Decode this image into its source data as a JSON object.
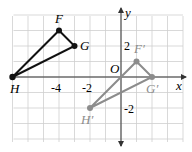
{
  "figure": {
    "axes": {
      "x_label": "x",
      "y_label": "y",
      "origin_label": "O"
    },
    "ticks": {
      "x": [
        "-4",
        "-2"
      ],
      "y": [
        "2",
        "-2"
      ]
    },
    "grid": {
      "x_min": -7,
      "x_max": 4,
      "y_min": -4,
      "y_max": 4
    },
    "original_triangle": {
      "color": "#111111",
      "vertices": [
        {
          "name": "F",
          "x": -4,
          "y": 3
        },
        {
          "name": "G",
          "x": -3,
          "y": 2
        },
        {
          "name": "H",
          "x": -7,
          "y": 0
        }
      ]
    },
    "image_triangle": {
      "color": "#8c8c8c",
      "vertices": [
        {
          "name": "F′",
          "x": 1,
          "y": 1
        },
        {
          "name": "G′",
          "x": 2,
          "y": 0
        },
        {
          "name": "H′",
          "x": -2,
          "y": -2
        }
      ]
    }
  }
}
